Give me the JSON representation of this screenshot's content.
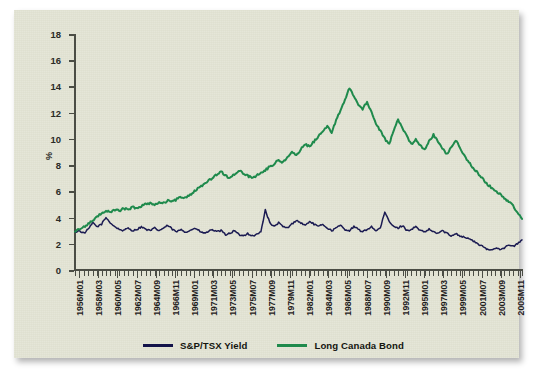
{
  "chart_data": {
    "type": "line",
    "title": "",
    "subtitle": "",
    "xlabel": "",
    "ylabel": "%",
    "ylim": [
      0,
      18
    ],
    "yticks": [
      0,
      2,
      4,
      6,
      8,
      10,
      12,
      14,
      16,
      18
    ],
    "grid": false,
    "legend_position": "bottom-center",
    "xtick_labels": [
      "1956M01",
      "1958M03",
      "1960M05",
      "1962M07",
      "1964M09",
      "1966M11",
      "1969M01",
      "1971M03",
      "1973M05",
      "1975M07",
      "1977M09",
      "1979M11",
      "1982M01",
      "1984M03",
      "1986M05",
      "1988M07",
      "1990M09",
      "1992M11",
      "1995M01",
      "1997M03",
      "1999M05",
      "2001M07",
      "2003M09",
      "2005M11"
    ],
    "x_start": "1956M01",
    "x_end": "2006M12",
    "n_points": 102,
    "series": [
      {
        "name": "S&P/TSX Yield",
        "color": "#1b1b52",
        "values": [
          2.9,
          3.0,
          2.8,
          3.1,
          3.6,
          3.3,
          3.5,
          4.0,
          3.6,
          3.3,
          3.1,
          3.0,
          3.2,
          3.0,
          3.1,
          3.3,
          3.1,
          3.0,
          3.2,
          3.0,
          3.2,
          3.4,
          3.1,
          2.9,
          3.1,
          2.9,
          3.0,
          3.2,
          3.0,
          2.8,
          2.9,
          3.1,
          2.9,
          3.0,
          2.7,
          2.8,
          3.0,
          2.7,
          2.6,
          2.8,
          2.6,
          2.7,
          2.9,
          4.6,
          3.6,
          3.3,
          3.6,
          3.3,
          3.2,
          3.5,
          3.8,
          3.6,
          3.4,
          3.7,
          3.5,
          3.3,
          3.5,
          3.2,
          3.0,
          3.2,
          3.4,
          3.1,
          3.0,
          3.3,
          3.1,
          2.9,
          3.1,
          3.3,
          3.0,
          3.2,
          4.4,
          3.7,
          3.3,
          3.2,
          3.4,
          3.0,
          3.1,
          3.3,
          3.0,
          2.9,
          3.1,
          2.9,
          2.8,
          3.0,
          2.8,
          2.6,
          2.8,
          2.6,
          2.5,
          2.4,
          2.2,
          2.0,
          1.8,
          1.6,
          1.5,
          1.7,
          1.6,
          1.7,
          1.9,
          1.8,
          2.0,
          2.3
        ]
      },
      {
        "name": "Long Canada Bond",
        "color": "#1f8a4c",
        "values": [
          3.0,
          3.1,
          3.3,
          3.5,
          3.8,
          4.1,
          4.3,
          4.5,
          4.4,
          4.6,
          4.5,
          4.7,
          4.6,
          4.8,
          4.7,
          4.9,
          5.0,
          5.1,
          5.0,
          5.2,
          5.1,
          5.3,
          5.2,
          5.4,
          5.6,
          5.5,
          5.7,
          6.0,
          6.3,
          6.5,
          6.8,
          7.0,
          7.3,
          7.5,
          7.2,
          7.0,
          7.3,
          7.6,
          7.4,
          7.2,
          7.0,
          7.2,
          7.4,
          7.6,
          7.9,
          8.1,
          8.4,
          8.2,
          8.6,
          9.0,
          8.7,
          9.2,
          9.6,
          9.4,
          9.8,
          10.2,
          10.6,
          11.0,
          10.5,
          11.4,
          12.2,
          13.0,
          13.9,
          13.2,
          12.6,
          12.3,
          12.8,
          12.0,
          11.2,
          10.6,
          10.0,
          9.6,
          10.6,
          11.5,
          10.8,
          10.2,
          9.6,
          10.0,
          9.5,
          9.2,
          9.8,
          10.3,
          9.8,
          9.3,
          8.8,
          9.4,
          9.9,
          9.3,
          8.7,
          8.2,
          7.8,
          7.4,
          7.0,
          6.6,
          6.3,
          6.0,
          5.8,
          5.5,
          5.2,
          4.9,
          4.4,
          3.9
        ]
      }
    ]
  },
  "legend": {
    "items": [
      {
        "label": "S&P/TSX Yield",
        "color": "#13134a"
      },
      {
        "label": "Long Canada Bond",
        "color": "#1f8a4c"
      }
    ]
  },
  "axis": {
    "y_title": "%"
  }
}
